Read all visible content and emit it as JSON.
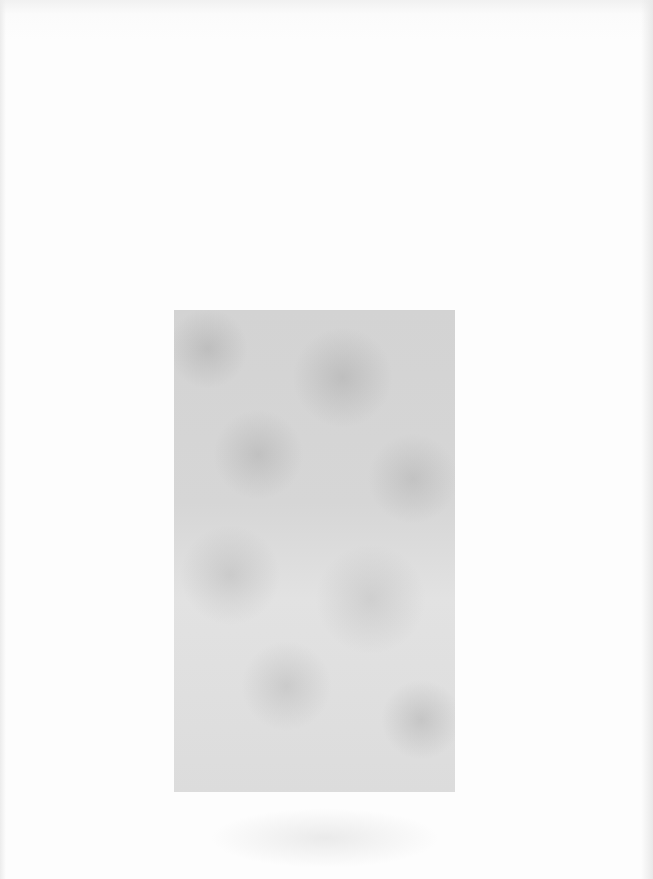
{
  "document": {
    "type": "scanned-page",
    "text": "",
    "figure": {
      "kind": "gray-plate",
      "color": "#d9d9d9",
      "caption": ""
    },
    "background_color": "#fcfcfc"
  }
}
